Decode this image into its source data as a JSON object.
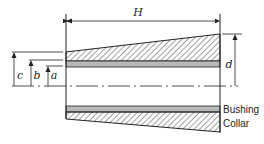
{
  "diagram": {
    "type": "tapered bushing and collar cross-section",
    "colors": {
      "line": "#222222",
      "bushing_fill": "#b8b8b8",
      "hatch": "#444444",
      "background": "#ffffff"
    },
    "dimensions": {
      "H": "H",
      "d": "d",
      "a": "a",
      "b": "b",
      "c": "c"
    },
    "labels": {
      "bushing": "Bushing",
      "collar": "Collar"
    }
  }
}
